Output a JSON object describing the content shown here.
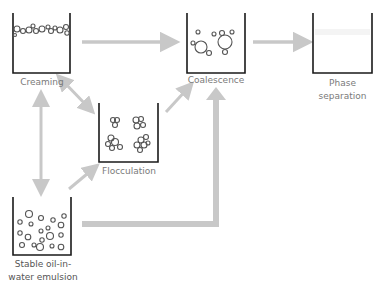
{
  "diagram": {
    "nodes": [
      {
        "id": "creaming",
        "label": "Creaming"
      },
      {
        "id": "coalescence",
        "label": "Coalescence"
      },
      {
        "id": "phase_separation",
        "label_line1": "Phase",
        "label_line2": "separation"
      },
      {
        "id": "flocculation",
        "label": "Flocculation"
      },
      {
        "id": "stable",
        "label_line1": "Stable oil-in-",
        "label_line2": "water emulsion"
      }
    ],
    "edges": [
      {
        "from": "creaming",
        "to": "coalescence",
        "direction": "forward"
      },
      {
        "from": "coalescence",
        "to": "phase_separation",
        "direction": "forward"
      },
      {
        "from": "creaming",
        "to": "flocculation",
        "direction": "both"
      },
      {
        "from": "flocculation",
        "to": "coalescence",
        "direction": "forward"
      },
      {
        "from": "stable",
        "to": "creaming",
        "direction": "both"
      },
      {
        "from": "stable",
        "to": "flocculation",
        "direction": "forward"
      },
      {
        "from": "stable",
        "to": "coalescence",
        "direction": "forward"
      }
    ],
    "colors": {
      "arrow": "#c8c8c8",
      "container": "#1a1a1a",
      "droplet": "#555555",
      "label": "#7a7a7a"
    }
  }
}
